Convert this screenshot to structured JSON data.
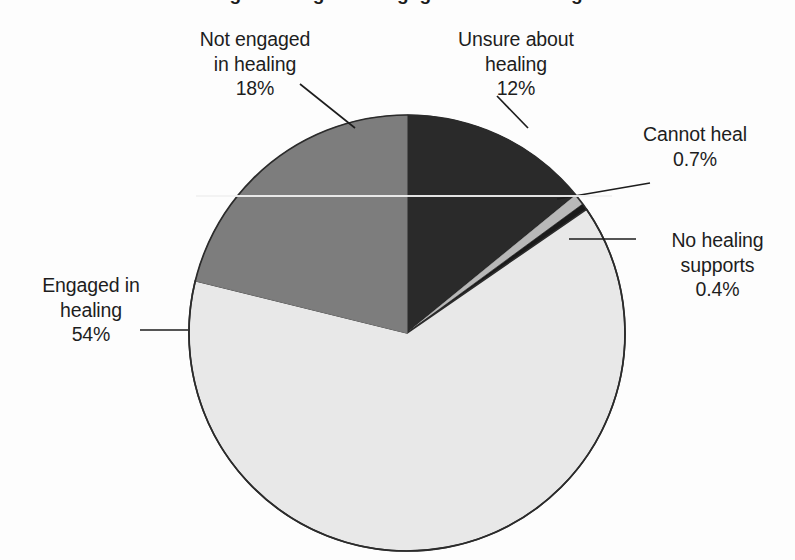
{
  "title": {
    "text_cut_off": "Figure: Stages of engagement in healing",
    "note": "title is cropped off the top edge of the screenshot; only letter descenders are visible"
  },
  "chart_data": {
    "type": "pie",
    "title": "Figure: Stages of engagement in healing",
    "xlabel": "",
    "ylabel": "",
    "grid": false,
    "legend_position": "none",
    "label_style": "external labels with leader lines",
    "start_angle_deg": 0,
    "direction": "clockwise",
    "units": "percent",
    "categories": [
      "Unsure about healing",
      "Cannot heal",
      "No healing supports",
      "Engaged in healing",
      "Not engaged in healing"
    ],
    "values": [
      12,
      0.7,
      0.4,
      54,
      18
    ],
    "value_labels": [
      "12%",
      "0.7%",
      "0.4%",
      "54%",
      "18%"
    ],
    "colors": [
      "#2a2a2a",
      "#b8b8b8",
      "#1a1a1a",
      "#e8e8e8",
      "#7d7d7d"
    ],
    "slices": [
      {
        "name": "Unsure about healing",
        "label_line1": "Unsure about",
        "label_line2": "healing",
        "value": 12,
        "value_label": "12%",
        "color": "#2a2a2a",
        "start_angle_deg": 0,
        "end_angle_deg": 43.2,
        "has_leader_line": true
      },
      {
        "name": "Cannot heal",
        "label_line1": "Cannot heal",
        "label_line2": "",
        "value": 0.7,
        "value_label": "0.7%",
        "color": "#b8b8b8",
        "start_angle_deg": 43.2,
        "end_angle_deg": 45.72,
        "has_leader_line": true
      },
      {
        "name": "No healing supports",
        "label_line1": "No healing",
        "label_line2": "supports",
        "value": 0.4,
        "value_label": "0.4%",
        "color": "#1a1a1a",
        "start_angle_deg": 45.72,
        "end_angle_deg": 47.16,
        "has_leader_line": true
      },
      {
        "name": "Engaged in healing",
        "label_line1": "Engaged in",
        "label_line2": "healing",
        "value": 54,
        "value_label": "54%",
        "color": "#e8e8e8",
        "start_angle_deg": 47.16,
        "end_angle_deg": 241.56,
        "has_leader_line": true
      },
      {
        "name": "Not engaged in healing",
        "label_line1": "Not engaged",
        "label_line2": "in healing",
        "value": 18,
        "value_label": "18%",
        "color": "#7d7d7d",
        "start_angle_deg": 241.56,
        "end_angle_deg": 306.36,
        "has_leader_line": true
      }
    ],
    "geometry": {
      "center_x": 407,
      "center_y": 333,
      "radius": 218,
      "outline_color": "#2b2b2b"
    }
  },
  "labels": {
    "not_engaged": {
      "line1": "Not engaged",
      "line2": "in healing",
      "pct": "18%"
    },
    "unsure": {
      "line1": "Unsure about",
      "line2": "healing",
      "pct": "12%"
    },
    "cannot_heal": {
      "line1": "Cannot heal",
      "line2": "",
      "pct": "0.7%"
    },
    "no_supports": {
      "line1": "No healing",
      "line2": "supports",
      "pct": "0.4%"
    },
    "engaged": {
      "line1": "Engaged in",
      "line2": "healing",
      "pct": "54%"
    }
  }
}
